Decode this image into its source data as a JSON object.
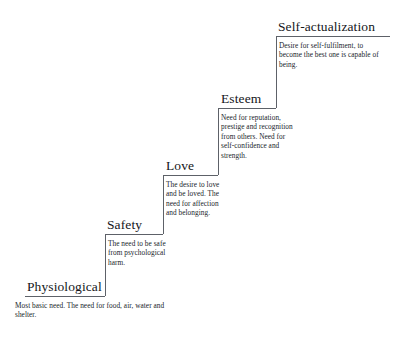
{
  "diagram": {
    "title_text": "",
    "background_color": "#ffffff",
    "line_color": "#5d6168",
    "text_color": "#14161a",
    "levels": [
      {
        "id": "physiological",
        "rank": 1,
        "title": "Physiological",
        "description": "Most basic need. The need for food, air, water and shelter."
      },
      {
        "id": "safety",
        "rank": 2,
        "title": "Safety",
        "description": "The need to be safe from psychological harm."
      },
      {
        "id": "love",
        "rank": 3,
        "title": "Love",
        "description": "The desire to love and be loved. The need for affection and belonging."
      },
      {
        "id": "esteem",
        "rank": 4,
        "title": "Esteem",
        "description": "Need for reputation, prestige and recognition from others. Need for self-confidence and strength."
      },
      {
        "id": "selfact",
        "rank": 5,
        "title": "Self-actualization",
        "description": "Desire for self-fulfilment, to become the best one is capable of being."
      }
    ]
  }
}
